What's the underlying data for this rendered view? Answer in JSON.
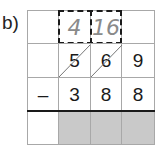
{
  "question_label": "b)",
  "exchange_row": {
    "cells": [
      "",
      "4",
      "16",
      ""
    ]
  },
  "minuend_row": {
    "cells": [
      "",
      "5",
      "6",
      "9"
    ]
  },
  "subtrahend_row": {
    "operator": "–",
    "cells": [
      "3",
      "8",
      "8"
    ]
  },
  "answer_row": {
    "cells": [
      "",
      "",
      "",
      ""
    ]
  },
  "colors": {
    "shade": "#c9c9c9",
    "grid": "#a8a8a8",
    "handwriting": "#8a8a8a"
  }
}
